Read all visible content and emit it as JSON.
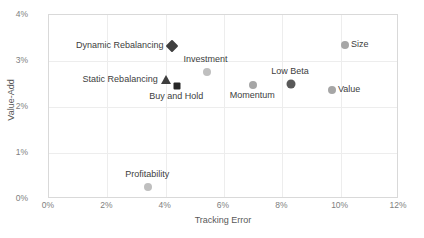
{
  "chart_data": {
    "type": "scatter",
    "title": "",
    "xlabel": "Tracking Error",
    "ylabel": "Value-Add",
    "xlim": [
      0,
      12
    ],
    "ylim": [
      0,
      4
    ],
    "xticks": [
      "0%",
      "2%",
      "4%",
      "6%",
      "8%",
      "10%",
      "12%"
    ],
    "xtick_values": [
      0,
      2,
      4,
      6,
      8,
      10,
      12
    ],
    "yticks": [
      "0%",
      "1%",
      "2%",
      "3%",
      "4%"
    ],
    "ytick_values": [
      0,
      1,
      2,
      3,
      4
    ],
    "grid": true,
    "legend": "none",
    "points": [
      {
        "label": "Dynamic Rebalancing",
        "x": 4.2,
        "y": 3.33,
        "marker": "diamond",
        "color": "#3f3f3f",
        "size": 9,
        "label_pos": "left"
      },
      {
        "label": "Investment",
        "x": 5.4,
        "y": 2.76,
        "marker": "circle",
        "color": "#bfbfbf",
        "size": 8,
        "label_pos": "above"
      },
      {
        "label": "Static Rebalancing",
        "x": 4.0,
        "y": 2.59,
        "marker": "triangle",
        "color": "#3f3f3f",
        "size": 9,
        "label_pos": "left"
      },
      {
        "label": "Buy and Hold",
        "x": 4.4,
        "y": 2.46,
        "marker": "square",
        "color": "#262626",
        "size": 7,
        "label_pos": "below"
      },
      {
        "label": "Momentum",
        "x": 7.0,
        "y": 2.48,
        "marker": "circle",
        "color": "#a6a6a6",
        "size": 8,
        "label_pos": "below"
      },
      {
        "label": "Low Beta",
        "x": 8.3,
        "y": 2.5,
        "marker": "circle",
        "color": "#595959",
        "size": 9,
        "label_pos": "above"
      },
      {
        "label": "Value",
        "x": 9.7,
        "y": 2.37,
        "marker": "circle",
        "color": "#a6a6a6",
        "size": 8,
        "label_pos": "right"
      },
      {
        "label": "Size",
        "x": 10.15,
        "y": 3.35,
        "marker": "circle",
        "color": "#a6a6a6",
        "size": 8,
        "label_pos": "right"
      },
      {
        "label": "Profitability",
        "x": 3.4,
        "y": 0.26,
        "marker": "circle",
        "color": "#bfbfbf",
        "size": 8,
        "label_pos": "above"
      }
    ]
  }
}
